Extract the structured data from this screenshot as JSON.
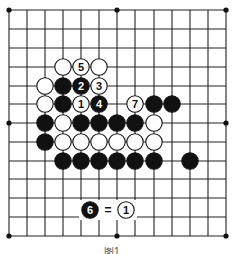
{
  "board": {
    "size": 13,
    "x_lines": [
      9,
      27,
      45,
      63,
      81,
      99,
      117,
      135,
      154,
      172,
      190,
      208,
      226
    ],
    "y_lines": [
      10,
      29,
      48,
      67,
      86,
      104,
      123,
      142,
      161,
      179,
      198,
      217,
      236
    ],
    "line_color": "#222222",
    "star_points": [
      [
        0,
        0
      ],
      [
        6,
        0
      ],
      [
        12,
        0
      ],
      [
        0,
        6
      ],
      [
        12,
        6
      ],
      [
        0,
        12
      ],
      [
        6,
        12
      ],
      [
        12,
        12
      ]
    ]
  },
  "stones": [
    {
      "col": 3,
      "row": 3,
      "color": "white",
      "label": ""
    },
    {
      "col": 4,
      "row": 3,
      "color": "white",
      "label": "5"
    },
    {
      "col": 5,
      "row": 3,
      "color": "white",
      "label": ""
    },
    {
      "col": 2,
      "row": 4,
      "color": "white",
      "label": ""
    },
    {
      "col": 3,
      "row": 4,
      "color": "black",
      "label": ""
    },
    {
      "col": 4,
      "row": 4,
      "color": "black",
      "label": "2"
    },
    {
      "col": 5,
      "row": 4,
      "color": "white",
      "label": "3"
    },
    {
      "col": 2,
      "row": 5,
      "color": "white",
      "label": ""
    },
    {
      "col": 3,
      "row": 5,
      "color": "black",
      "label": ""
    },
    {
      "col": 4,
      "row": 5,
      "color": "white",
      "label": "1"
    },
    {
      "col": 5,
      "row": 5,
      "color": "black",
      "label": "4"
    },
    {
      "col": 7,
      "row": 5,
      "color": "white",
      "label": "7"
    },
    {
      "col": 8,
      "row": 5,
      "color": "black",
      "label": ""
    },
    {
      "col": 9,
      "row": 5,
      "color": "black",
      "label": ""
    },
    {
      "col": 2,
      "row": 6,
      "color": "black",
      "label": ""
    },
    {
      "col": 3,
      "row": 6,
      "color": "white",
      "label": ""
    },
    {
      "col": 4,
      "row": 6,
      "color": "black",
      "label": ""
    },
    {
      "col": 5,
      "row": 6,
      "color": "black",
      "label": ""
    },
    {
      "col": 6,
      "row": 6,
      "color": "black",
      "label": ""
    },
    {
      "col": 7,
      "row": 6,
      "color": "black",
      "label": ""
    },
    {
      "col": 8,
      "row": 6,
      "color": "white",
      "label": ""
    },
    {
      "col": 2,
      "row": 7,
      "color": "black",
      "label": ""
    },
    {
      "col": 3,
      "row": 7,
      "color": "white",
      "label": ""
    },
    {
      "col": 4,
      "row": 7,
      "color": "white",
      "label": ""
    },
    {
      "col": 5,
      "row": 7,
      "color": "white",
      "label": ""
    },
    {
      "col": 6,
      "row": 7,
      "color": "white",
      "label": ""
    },
    {
      "col": 7,
      "row": 7,
      "color": "white",
      "label": ""
    },
    {
      "col": 8,
      "row": 7,
      "color": "white",
      "label": ""
    },
    {
      "col": 3,
      "row": 8,
      "color": "black",
      "label": ""
    },
    {
      "col": 4,
      "row": 8,
      "color": "black",
      "label": ""
    },
    {
      "col": 5,
      "row": 8,
      "color": "black",
      "label": ""
    },
    {
      "col": 6,
      "row": 8,
      "color": "black",
      "label": ""
    },
    {
      "col": 7,
      "row": 8,
      "color": "black",
      "label": ""
    },
    {
      "col": 8,
      "row": 8,
      "color": "black",
      "label": ""
    },
    {
      "col": 10,
      "row": 8,
      "color": "black",
      "label": ""
    }
  ],
  "annotation": {
    "left_stone": {
      "color": "black",
      "label": "6",
      "x": 90,
      "y": 210
    },
    "equals": "=",
    "right_stone": {
      "color": "white",
      "label": "1",
      "x": 126,
      "y": 210
    }
  },
  "caption": "图1"
}
